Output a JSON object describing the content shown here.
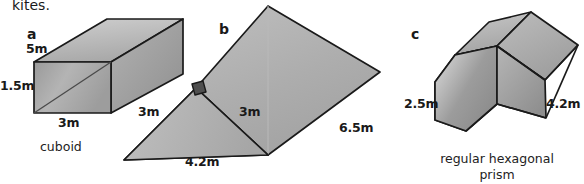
{
  "page": {
    "lead_text": "kites.",
    "background_color": "#ffffff",
    "ink_color": "#1a1a1a"
  },
  "figures": [
    {
      "tag": "a",
      "shape": "cuboid",
      "caption": "cuboid",
      "dimensions": [
        {
          "value": "5m",
          "edge": "depth"
        },
        {
          "value": "1.5m",
          "edge": "height"
        },
        {
          "value": "3m",
          "edge": "width"
        }
      ]
    },
    {
      "tag": "b",
      "shape": "triangular-prism",
      "caption": "",
      "right_angle_marker": true,
      "dimensions": [
        {
          "value": "3m",
          "edge": "slant-left"
        },
        {
          "value": "3m",
          "edge": "slant-right"
        },
        {
          "value": "4.2m",
          "edge": "base"
        },
        {
          "value": "6.5m",
          "edge": "length"
        }
      ]
    },
    {
      "tag": "c",
      "shape": "regular-hexagonal-prism",
      "caption_line1": "regular hexagonal",
      "caption_line2": "prism",
      "dimensions": [
        {
          "value": "2.5m",
          "edge": "hexagon-side"
        },
        {
          "value": "4.2m",
          "edge": "length"
        }
      ]
    }
  ],
  "colors": {
    "face_light": "#c3c3c3",
    "face_mid": "#ababab",
    "face_dark": "#949494",
    "face_darker": "#878787",
    "outline": "#1a1a1a"
  }
}
